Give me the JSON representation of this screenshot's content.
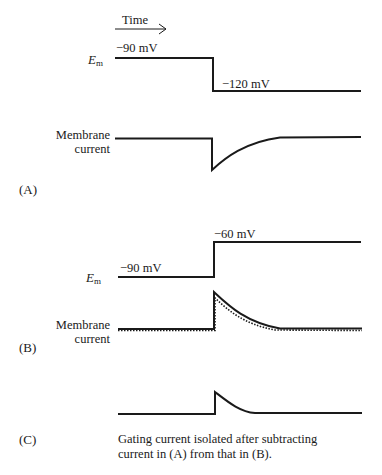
{
  "time_axis": {
    "label": "Time",
    "arrow": "right-arrow"
  },
  "panel_a": {
    "tag": "(A)",
    "em_label": "E",
    "em_sub": "m",
    "holding_voltage": "−90 mV",
    "step_voltage": "−120 mV",
    "current_label_line1": "Membrane",
    "current_label_line2": "current"
  },
  "panel_b": {
    "tag": "(B)",
    "em_label": "E",
    "em_sub": "m",
    "holding_voltage": "−90 mV",
    "step_voltage": "−60 mV",
    "current_label_line1": "Membrane",
    "current_label_line2": "current"
  },
  "panel_c": {
    "tag": "(C)",
    "caption_line1": "Gating current isolated after subtracting",
    "caption_line2": "current in (A) from that in (B)."
  },
  "colors": {
    "trace": "#1a1a1a",
    "background": "#ffffff"
  }
}
